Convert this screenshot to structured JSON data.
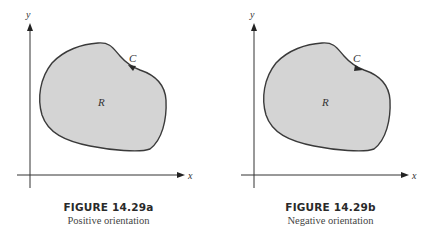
{
  "figures": [
    {
      "id": "a",
      "title": "FIGURE 14.29a",
      "subtitle": "Positive orientation",
      "axis_labels": {
        "x": "x",
        "y": "y"
      },
      "region_label": "R",
      "curve_label": "C",
      "orientation": "counterclockwise"
    },
    {
      "id": "b",
      "title": "FIGURE 14.29b",
      "subtitle": "Negative orientation",
      "axis_labels": {
        "x": "x",
        "y": "y"
      },
      "region_label": "R",
      "curve_label": "C",
      "orientation": "clockwise"
    }
  ],
  "colors": {
    "region_fill": "#d4d4d4",
    "curve_stroke": "#3a3a3a",
    "axis_stroke": "#333333"
  }
}
